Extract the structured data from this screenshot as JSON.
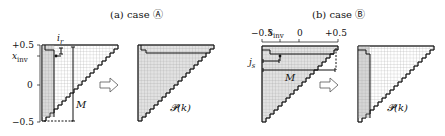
{
  "panel_a": {
    "title": "(a) case Ⓐ",
    "y_ticks": [
      "+0.5",
      "0",
      "−0.5"
    ],
    "axis_label": "x_inv",
    "axis_label_main": "x",
    "axis_label_sub": "inv",
    "index_label": "i",
    "index_sub": "r",
    "range_label": "M",
    "result_label": "𝓟(k)"
  },
  "panel_b": {
    "title": "(b) case Ⓑ",
    "x_ticks": [
      "−0.5",
      "0",
      "+0.5"
    ],
    "axis_label": "x_inv",
    "axis_label_main": "x",
    "axis_label_sub": "inv",
    "index_label": "j",
    "index_sub": "s",
    "range_label": "M",
    "result_label": "𝓟(k)"
  },
  "arrow_icon": "right-hollow-arrow",
  "colors": {
    "shade": "#d6d6d6",
    "grid": "#9a9a9a",
    "line": "#111111"
  }
}
